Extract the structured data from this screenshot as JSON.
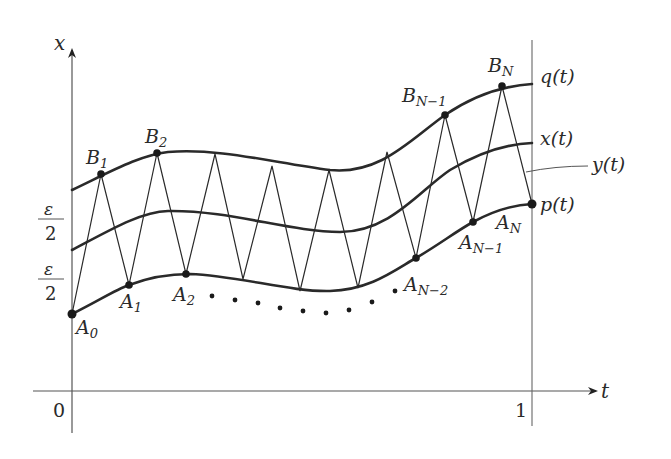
{
  "axes": {
    "x_axis_label": "t",
    "y_axis_label": "x",
    "tick_zero": "0",
    "tick_one": "1"
  },
  "epsilon_labels": {
    "upper": {
      "numerator": "ε",
      "denominator": "2"
    },
    "lower": {
      "numerator": "ε",
      "denominator": "2"
    }
  },
  "curve_labels": {
    "q": "q(t)",
    "x": "x(t)",
    "y": "y(t)",
    "p": "p(t)"
  },
  "points": {
    "A0": {
      "base": "A",
      "sub": "0"
    },
    "A1": {
      "base": "A",
      "sub": "1"
    },
    "A2": {
      "base": "A",
      "sub": "2"
    },
    "AN2": {
      "base": "A",
      "sub": "N−2"
    },
    "AN1": {
      "base": "A",
      "sub": "N−1"
    },
    "AN": {
      "base": "A",
      "sub": "N"
    },
    "B1": {
      "base": "B",
      "sub": "1"
    },
    "B2": {
      "base": "B",
      "sub": "2"
    },
    "BN1": {
      "base": "B",
      "sub": "N−1"
    },
    "BN": {
      "base": "B",
      "sub": "N"
    }
  },
  "colors": {
    "curve": "#2a2a2a",
    "axis": "#555555",
    "zigzag": "#2a2a2a"
  }
}
